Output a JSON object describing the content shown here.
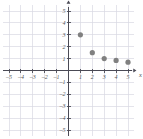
{
  "chart_data": {
    "type": "scatter",
    "title": "",
    "xlabel": "x",
    "ylabel": "y",
    "xlim": [
      -5.6,
      5.6
    ],
    "ylim": [
      -5.6,
      5.6
    ],
    "grid": true,
    "legend": null,
    "x_ticks": [
      -5,
      -4,
      -3,
      -2,
      -1,
      1,
      2,
      3,
      4,
      5
    ],
    "y_ticks": [
      5,
      4,
      3,
      2,
      1,
      -1,
      -2,
      -3,
      -4,
      -5
    ],
    "x_tick_labels": [
      "–5",
      "–4",
      "–3",
      "–2",
      "–1",
      "1",
      "2",
      "3",
      "4",
      "5"
    ],
    "y_tick_labels": [
      "5",
      "4",
      "3",
      "2",
      "1",
      "–1",
      "–2",
      "–3",
      "–4",
      "–5"
    ],
    "points": [
      {
        "x": 1,
        "y": 3
      },
      {
        "x": 2,
        "y": 1.5
      },
      {
        "x": 3,
        "y": 1
      },
      {
        "x": 4,
        "y": 0.85
      },
      {
        "x": 5,
        "y": 0.7
      }
    ],
    "point_color": "#808080",
    "grid_color": "#d8d8e2",
    "axis_color": "#4a4a55",
    "point_radius": 2.6
  },
  "axes": {
    "x_name": "x",
    "y_name": "y"
  }
}
